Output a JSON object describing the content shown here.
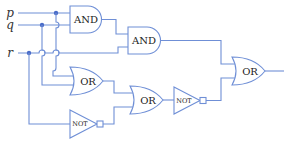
{
  "diagram": {
    "type": "logic-circuit",
    "inputs": [
      {
        "id": "p",
        "label": "p"
      },
      {
        "id": "q",
        "label": "q"
      },
      {
        "id": "r",
        "label": "r"
      }
    ],
    "gates": [
      {
        "id": "and1",
        "type": "AND",
        "label": "AND",
        "inputs": [
          "p",
          "q"
        ]
      },
      {
        "id": "and2",
        "type": "AND",
        "label": "AND",
        "inputs": [
          "and1",
          "r"
        ]
      },
      {
        "id": "or1",
        "type": "OR",
        "label": "OR",
        "inputs": [
          "p",
          "q"
        ]
      },
      {
        "id": "not1",
        "type": "NOT",
        "label": "NOT",
        "inputs": [
          "r"
        ]
      },
      {
        "id": "or2",
        "type": "OR",
        "label": "OR",
        "inputs": [
          "or1",
          "not1"
        ]
      },
      {
        "id": "not2",
        "type": "NOT",
        "label": "NOT",
        "inputs": [
          "or2"
        ]
      },
      {
        "id": "or3",
        "type": "OR",
        "label": "OR",
        "inputs": [
          "and2",
          "not2"
        ]
      }
    ],
    "output": "or3"
  },
  "colors": {
    "wire": "#6f8fd6",
    "junction": "#4a6cc8",
    "text": "#222222"
  }
}
